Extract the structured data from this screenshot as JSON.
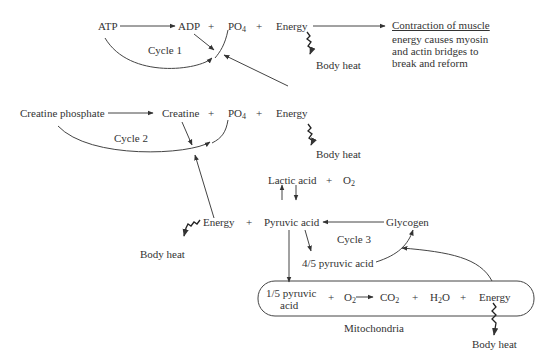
{
  "diagram": {
    "cycle1": {
      "label": "Cycle 1",
      "atp": "ATP",
      "adp": "ADP",
      "plus": "+",
      "po4": "PO",
      "po4_sub": "4",
      "energy": "Energy",
      "body_heat": "Body heat",
      "contraction_title": "Contraction of muscle",
      "contraction_lines": [
        "energy causes myosin",
        "and actin bridges to",
        "break and reform"
      ]
    },
    "cycle2": {
      "label": "Cycle 2",
      "creatine_phosphate": "Creatine phosphate",
      "creatine": "Creatine",
      "po4": "PO",
      "po4_sub": "4",
      "energy": "Energy",
      "body_heat": "Body heat"
    },
    "cycle3": {
      "label": "Cycle 3",
      "lactic_acid": "Lactic acid",
      "o2": "O",
      "o2_sub": "2",
      "energy": "Energy",
      "pyruvic_acid": "Pyruvic acid",
      "glycogen": "Glycogen",
      "four_fifths": "4/5 pyruvic acid",
      "body_heat": "Body heat"
    },
    "mitochondria": {
      "label": "Mitochondria",
      "one_fifth_line1": "1/5 pyruvic",
      "one_fifth_line2": "acid",
      "o2": "O",
      "o2_sub": "2",
      "co2": "CO",
      "co2_sub": "2",
      "h2o_h": "H",
      "h2o_sub": "2",
      "h2o_o": "O",
      "energy": "Energy",
      "body_heat": "Body heat"
    },
    "plus": "+"
  },
  "colors": {
    "ink": "#333333",
    "background": "#ffffff"
  }
}
